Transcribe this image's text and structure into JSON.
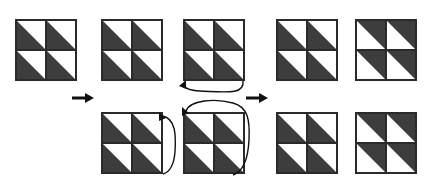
{
  "diagram": {
    "canvas": {
      "width": 425,
      "height": 181
    },
    "colors": {
      "dark_fill": "#3d3d3d",
      "light_fill": "#ffffff",
      "outline": "#2a2a2a",
      "background": "#ffffff",
      "arrow": "#111111"
    },
    "legend": {
      "dark_label": "dark triangle",
      "light_label": "light triangle"
    },
    "blocks": [
      {
        "id": "block-top-1",
        "name": "top-row-block-1",
        "row": "top",
        "index": 1,
        "pattern": "all-dark-lower-left",
        "x": 15,
        "y": 19,
        "size": 62,
        "cells": [
          "dark-lower-left",
          "dark-lower-left",
          "dark-lower-left",
          "dark-lower-left"
        ]
      },
      {
        "id": "block-top-2",
        "name": "top-row-block-2",
        "row": "top",
        "index": 2,
        "pattern": "all-dark-lower-left",
        "x": 101,
        "y": 19,
        "size": 62,
        "cells": [
          "dark-lower-left",
          "dark-lower-left",
          "dark-lower-left",
          "dark-lower-left"
        ]
      },
      {
        "id": "block-top-3",
        "name": "top-row-block-3",
        "row": "top",
        "index": 3,
        "pattern": "all-dark-lower-left",
        "x": 183,
        "y": 19,
        "size": 62,
        "cells": [
          "dark-lower-left",
          "dark-lower-left",
          "dark-lower-left",
          "dark-lower-left"
        ]
      },
      {
        "id": "block-top-4",
        "name": "top-row-block-4",
        "row": "top",
        "index": 4,
        "pattern": "all-dark-lower-left",
        "x": 276,
        "y": 19,
        "size": 62,
        "cells": [
          "dark-lower-left",
          "dark-lower-left",
          "dark-lower-left",
          "dark-lower-left"
        ]
      },
      {
        "id": "block-top-5",
        "name": "top-row-block-5",
        "row": "top",
        "index": 5,
        "pattern": "all-dark-upper-right",
        "x": 355,
        "y": 19,
        "size": 62,
        "cells": [
          "dark-upper-right",
          "dark-upper-right",
          "dark-upper-right",
          "dark-upper-right"
        ]
      },
      {
        "id": "block-bottom-1",
        "name": "bottom-row-block-1",
        "row": "bottom",
        "index": 1,
        "pattern": "all-dark-lower-left",
        "x": 101,
        "y": 112,
        "size": 62,
        "cells": [
          "dark-lower-left",
          "dark-lower-left",
          "dark-lower-left",
          "dark-lower-left"
        ]
      },
      {
        "id": "block-bottom-2",
        "name": "bottom-row-block-2",
        "row": "bottom",
        "index": 2,
        "pattern": "all-dark-lower-left",
        "x": 183,
        "y": 112,
        "size": 62,
        "cells": [
          "dark-lower-left",
          "dark-lower-left",
          "dark-lower-left",
          "dark-lower-left"
        ]
      },
      {
        "id": "block-bottom-3",
        "name": "bottom-row-block-3",
        "row": "bottom",
        "index": 3,
        "pattern": "all-dark-lower-left-alt",
        "x": 276,
        "y": 112,
        "size": 62,
        "cells": [
          "dark-lower-left",
          "dark-lower-left",
          "dark-lower-left",
          "dark-lower-left"
        ]
      },
      {
        "id": "block-bottom-4",
        "name": "bottom-row-block-4",
        "row": "bottom",
        "index": 4,
        "pattern": "all-dark-upper-right",
        "x": 355,
        "y": 112,
        "size": 62,
        "cells": [
          "dark-upper-right",
          "dark-upper-right",
          "dark-upper-right",
          "dark-upper-right"
        ]
      }
    ],
    "arrows": [
      {
        "id": "arrow-left",
        "name": "arrow-right-left-transition",
        "type": "straight",
        "direction": "right",
        "x": 72,
        "y": 92,
        "length": 22
      },
      {
        "id": "arrow-right",
        "name": "arrow-right-right-transition",
        "type": "straight",
        "direction": "right",
        "x": 246,
        "y": 92,
        "length": 22
      },
      {
        "id": "arrow-curve-top",
        "name": "curved-arrow-top-block-3-to-bottom-block-2",
        "type": "curved",
        "direction": "counterclockwise"
      },
      {
        "id": "arrow-curve-bottom-left",
        "name": "curved-arrow-bottom-block-1-wrap",
        "type": "curved",
        "direction": "clockwise"
      },
      {
        "id": "arrow-curve-bottom-right",
        "name": "curved-arrow-bottom-block-2-wrap",
        "type": "curved",
        "direction": "clockwise"
      }
    ]
  }
}
